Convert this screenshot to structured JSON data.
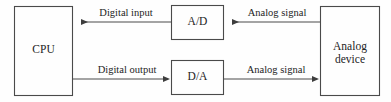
{
  "diagram": {
    "width": 391,
    "height": 102,
    "stroke_color": "#4a4a4a",
    "text_color": "#242424",
    "background_color": "#fefefe",
    "nodes": [
      {
        "id": "cpu",
        "label": "CPU",
        "x": 14,
        "y": 6,
        "w": 59,
        "h": 90
      },
      {
        "id": "ad",
        "label": "A/D",
        "x": 171,
        "y": 5,
        "w": 53,
        "h": 35
      },
      {
        "id": "da",
        "label": "D/A",
        "x": 171,
        "y": 60,
        "w": 53,
        "h": 35
      },
      {
        "id": "analog-device",
        "label": "Analog\ndevice",
        "x": 320,
        "y": 6,
        "w": 60,
        "h": 90
      }
    ],
    "edges": [
      {
        "id": "analog-to-ad",
        "label": "Analog signal",
        "from": "analog-device",
        "to": "ad",
        "direction": "left",
        "y": 22
      },
      {
        "id": "ad-to-cpu",
        "label": "Digital input",
        "from": "ad",
        "to": "cpu",
        "direction": "left",
        "y": 22
      },
      {
        "id": "cpu-to-da",
        "label": "Digital output",
        "from": "cpu",
        "to": "da",
        "direction": "right",
        "y": 79
      },
      {
        "id": "da-to-analog",
        "label": "Analog signal",
        "from": "da",
        "to": "analog-device",
        "direction": "right",
        "y": 79
      }
    ]
  }
}
